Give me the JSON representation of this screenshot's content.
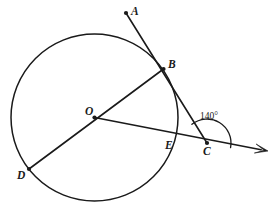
{
  "figure": {
    "kind": "circle-geometry-diagram",
    "background_color": "#ffffff",
    "stroke_color": "#1a1a1a",
    "width": 274,
    "height": 216
  },
  "circle": {
    "label": "circle O",
    "center_x": 94.5,
    "center_y": 117.5,
    "radius": 83.5
  },
  "points": {
    "A": {
      "label": "A",
      "x": 126,
      "y": 13,
      "label_x": 131,
      "label_y": 6,
      "has_dot": true
    },
    "B": {
      "label": "B",
      "x": 163.5,
      "y": 69,
      "label_x": 168,
      "label_y": 59,
      "has_dot": true
    },
    "O": {
      "label": "O",
      "x": 94.5,
      "y": 117.5,
      "label_x": 85,
      "label_y": 106,
      "has_dot": true
    },
    "C": {
      "label": "C",
      "x": 207,
      "y": 143,
      "label_x": 203,
      "label_y": 146,
      "has_dot": true
    },
    "D": {
      "label": "D",
      "x": 29,
      "y": 169,
      "label_x": 17,
      "label_y": 170,
      "has_dot": true
    },
    "E": {
      "label": "E",
      "x": 176,
      "y": 140,
      "label_x": 165,
      "label_y": 140,
      "has_dot": false
    }
  },
  "segments": [
    {
      "name": "ray-A-B-C",
      "from": "A",
      "to": "C",
      "description": "secant from A through B to C"
    },
    {
      "name": "diameter-B-O-D",
      "from": "B",
      "to": "D",
      "description": "diameter through center O"
    },
    {
      "name": "ray-O-E-C-arrow",
      "from": "O",
      "to": "arrow-tip",
      "description": "ray from O through E and C continuing right"
    }
  ],
  "ray_arrow": {
    "name": "right-ray-arrowhead",
    "tip_x": 268,
    "tip_y": 151
  },
  "angle": {
    "name": "angle-at-C",
    "value_label": "140°",
    "label_x": 200,
    "label_y": 112,
    "vertex": "C",
    "arc_radius": 24,
    "start_deg": 231,
    "end_deg": 11
  }
}
